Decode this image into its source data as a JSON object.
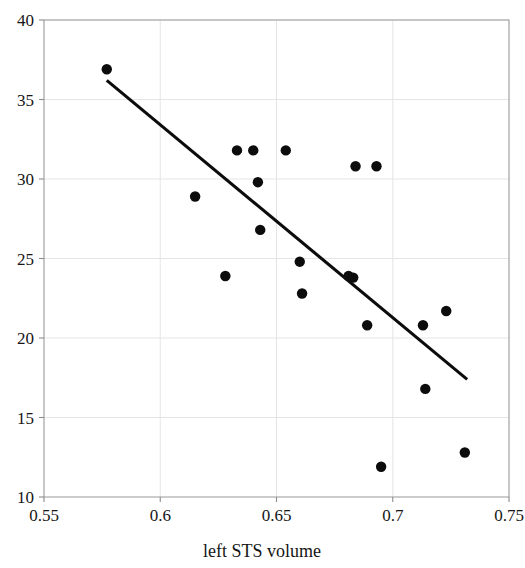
{
  "chart_data": {
    "type": "scatter",
    "title": "",
    "xlabel": "left STS volume",
    "ylabel": "",
    "xlim": [
      0.55,
      0.75
    ],
    "ylim": [
      10,
      40
    ],
    "xticks": [
      0.55,
      0.6,
      0.65,
      0.7,
      0.75
    ],
    "xtick_labels": [
      "0.55",
      "0.6",
      "0.65",
      "0.7",
      "0.75"
    ],
    "yticks": [
      10,
      15,
      20,
      25,
      30,
      35,
      40
    ],
    "ytick_labels": [
      "10",
      "15",
      "20",
      "25",
      "30",
      "35",
      "40"
    ],
    "grid": true,
    "legend": null,
    "marker": "filled-circle",
    "marker_color": "#0c0c0c",
    "points": [
      {
        "x": 0.577,
        "y": 36.9
      },
      {
        "x": 0.615,
        "y": 28.9
      },
      {
        "x": 0.628,
        "y": 23.9
      },
      {
        "x": 0.633,
        "y": 31.8
      },
      {
        "x": 0.64,
        "y": 31.8
      },
      {
        "x": 0.642,
        "y": 29.8
      },
      {
        "x": 0.643,
        "y": 26.8
      },
      {
        "x": 0.654,
        "y": 31.8
      },
      {
        "x": 0.66,
        "y": 24.8
      },
      {
        "x": 0.661,
        "y": 22.8
      },
      {
        "x": 0.681,
        "y": 23.9
      },
      {
        "x": 0.683,
        "y": 23.8
      },
      {
        "x": 0.684,
        "y": 30.8
      },
      {
        "x": 0.689,
        "y": 20.8
      },
      {
        "x": 0.693,
        "y": 30.8
      },
      {
        "x": 0.695,
        "y": 11.9
      },
      {
        "x": 0.713,
        "y": 20.8
      },
      {
        "x": 0.714,
        "y": 16.8
      },
      {
        "x": 0.723,
        "y": 21.7
      },
      {
        "x": 0.731,
        "y": 12.8
      }
    ],
    "trend_line": {
      "x0": 0.577,
      "y0": 36.2,
      "x1": 0.732,
      "y1": 17.4,
      "color": "#0c0c0c"
    }
  },
  "axis": {
    "x_title": "left STS volume"
  }
}
